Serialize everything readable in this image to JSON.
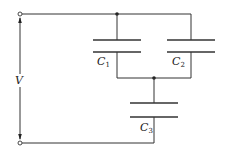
{
  "diagram": {
    "type": "circuit",
    "voltage_label": "V",
    "components": [
      {
        "id": "C1",
        "symbol": "C",
        "subscript": "1",
        "kind": "capacitor"
      },
      {
        "id": "C2",
        "symbol": "C",
        "subscript": "2",
        "kind": "capacitor"
      },
      {
        "id": "C3",
        "symbol": "C",
        "subscript": "3",
        "kind": "capacitor"
      }
    ],
    "colors": {
      "wire": "#333333",
      "background": "#ffffff"
    }
  }
}
